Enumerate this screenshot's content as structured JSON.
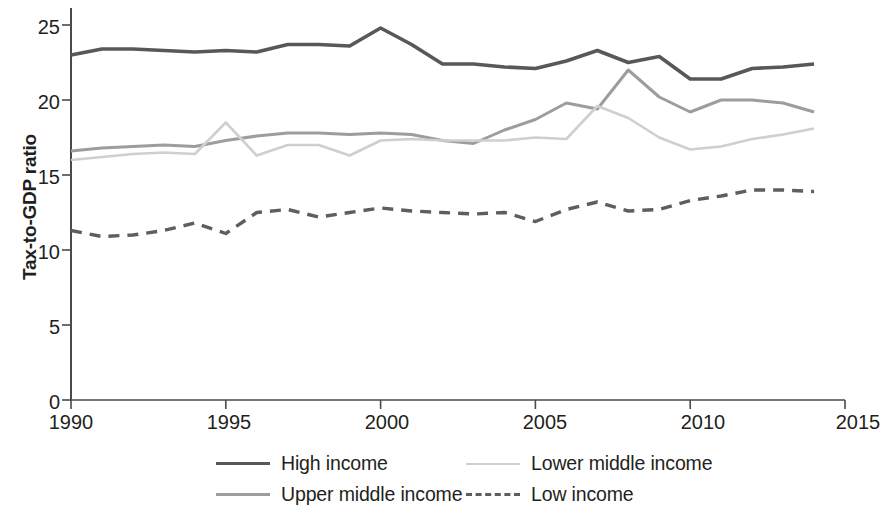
{
  "chart_data": {
    "type": "line",
    "title": "",
    "subtitle": "",
    "xlabel": "",
    "ylabel": "Tax-to-GDP ratio",
    "xlim": [
      1990,
      2015
    ],
    "ylim": [
      0,
      25
    ],
    "xticks": [
      1990,
      1995,
      2000,
      2005,
      2010,
      2015
    ],
    "yticks": [
      0,
      5,
      10,
      15,
      20,
      25
    ],
    "grid": false,
    "legend_position": "bottom",
    "x": [
      1990,
      1991,
      1992,
      1993,
      1994,
      1995,
      1996,
      1997,
      1998,
      1999,
      2000,
      2001,
      2002,
      2003,
      2004,
      2005,
      2006,
      2007,
      2008,
      2009,
      2010,
      2011,
      2012,
      2013,
      2014
    ],
    "series": [
      {
        "name": "High income",
        "color": "#585858",
        "style": "solid",
        "width": 3.6,
        "values": [
          23.0,
          23.4,
          23.4,
          23.3,
          23.2,
          23.3,
          23.2,
          23.7,
          23.7,
          23.6,
          24.8,
          23.7,
          22.4,
          22.4,
          22.2,
          22.1,
          22.6,
          23.3,
          22.5,
          22.9,
          21.4,
          21.4,
          22.1,
          22.2,
          22.4
        ]
      },
      {
        "name": "Upper middle income",
        "color": "#9d9d9d",
        "style": "solid",
        "width": 3.0,
        "values": [
          16.6,
          16.8,
          16.9,
          17.0,
          16.9,
          17.3,
          17.6,
          17.8,
          17.8,
          17.7,
          17.8,
          17.7,
          17.3,
          17.1,
          18.0,
          18.7,
          19.8,
          19.4,
          22.0,
          20.2,
          19.2,
          20.0,
          20.0,
          19.8,
          19.2
        ]
      },
      {
        "name": "Lower middle income",
        "color": "#cfcfcf",
        "style": "solid",
        "width": 2.6,
        "values": [
          16.0,
          16.2,
          16.4,
          16.5,
          16.4,
          18.5,
          16.3,
          17.0,
          17.0,
          16.3,
          17.3,
          17.4,
          17.3,
          17.3,
          17.3,
          17.5,
          17.4,
          19.6,
          18.8,
          17.5,
          16.7,
          16.9,
          17.4,
          17.7,
          18.1
        ]
      },
      {
        "name": "Low income",
        "color": "#5e5e5e",
        "style": "dashed",
        "width": 3.4,
        "values": [
          11.3,
          10.9,
          11.0,
          11.3,
          11.8,
          11.1,
          12.5,
          12.7,
          12.2,
          12.5,
          12.8,
          12.6,
          12.5,
          12.4,
          12.5,
          11.9,
          12.7,
          13.2,
          12.6,
          12.7,
          13.3,
          13.6,
          14.0,
          14.0,
          13.9
        ]
      }
    ]
  },
  "axes": {
    "ytick_labels": [
      "25",
      "20",
      "15",
      "10",
      "5",
      "0"
    ],
    "xtick_labels": [
      "1990",
      "1995",
      "2000",
      "2005",
      "2010",
      "2015"
    ],
    "ylabel": "Tax-to-GDP ratio"
  },
  "legend": {
    "items": [
      {
        "label": "High income",
        "color": "#585858",
        "style": "solid",
        "thickness": "3.6"
      },
      {
        "label": "Lower middle income",
        "color": "#cfcfcf",
        "style": "solid",
        "thickness": "2.6"
      },
      {
        "label": "Upper middle income",
        "color": "#9d9d9d",
        "style": "solid",
        "thickness": "3.0"
      },
      {
        "label": "Low income",
        "color": "#5e5e5e",
        "style": "dashed",
        "thickness": "3.4"
      }
    ]
  },
  "colors": {
    "axis": "#4a4a4a",
    "text": "#231f20",
    "background": "#ffffff"
  }
}
